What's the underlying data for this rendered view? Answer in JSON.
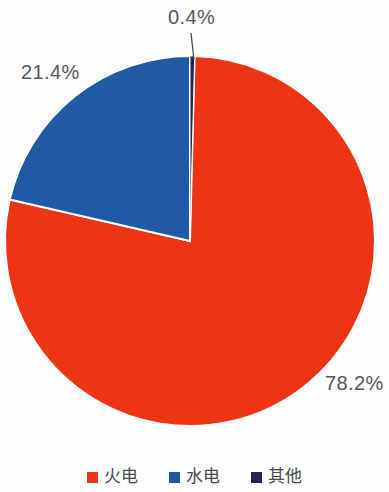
{
  "chart_data": {
    "type": "pie",
    "title": "",
    "subtitle": "",
    "xlabel": "",
    "ylabel": "",
    "grid": false,
    "legend_position": "bottom",
    "start_angle_deg": 0,
    "direction": "clockwise",
    "categories": [
      "火电",
      "水电",
      "其他"
    ],
    "values": [
      78.2,
      21.4,
      0.4
    ],
    "labels": [
      "78.2%",
      "21.4%",
      "0.4%"
    ],
    "colors": [
      "#ee3413",
      "#1f5aa5",
      "#2b2155"
    ],
    "slices": [
      {
        "name": "火电",
        "value": 78.2,
        "label": "78.2%",
        "color": "#ee3413",
        "start_deg": 1.44,
        "end_deg": 283.0,
        "label_position": "outside-bottom-right",
        "leader_line": false
      },
      {
        "name": "水电",
        "value": 21.4,
        "label": "21.4%",
        "color": "#1f5aa5",
        "start_deg": 283.0,
        "end_deg": 360.0,
        "label_position": "outside-top-left",
        "leader_line": false
      },
      {
        "name": "其他",
        "value": 0.4,
        "label": "0.4%",
        "color": "#2b2155",
        "start_deg": 0.0,
        "end_deg": 1.44,
        "label_position": "outside-top",
        "leader_line": true
      }
    ]
  },
  "geometry": {
    "center_x": 190,
    "center_y": 241,
    "radius": 185,
    "separator_color": "#ffffff",
    "separator_width": 2,
    "leader_line_color": "#4a4a4a"
  },
  "labels": {
    "other_pct": "0.4%",
    "hydro_pct": "21.4%",
    "thermal_pct": "78.2%"
  },
  "legend": {
    "items": [
      {
        "label": "火电",
        "color": "#ee3413"
      },
      {
        "label": "水电",
        "color": "#1f5aa5"
      },
      {
        "label": "其他",
        "color": "#2b2155"
      }
    ]
  }
}
